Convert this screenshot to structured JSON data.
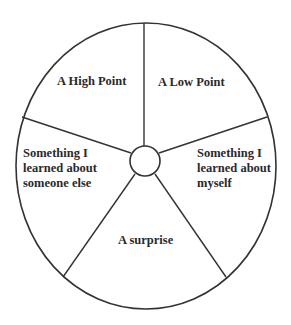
{
  "diagram": {
    "type": "wheel",
    "line_color": "#333333",
    "background_color": "#ffffff",
    "segments": [
      {
        "id": "high-point",
        "label": "A High Point"
      },
      {
        "id": "low-point",
        "label": "A Low Point"
      },
      {
        "id": "learned-myself",
        "label": "Something I\nlearned about\nmyself"
      },
      {
        "id": "surprise",
        "label": "A surprise"
      },
      {
        "id": "learned-someone-else",
        "label": "Something I\nlearned about\nsomeone else"
      }
    ]
  }
}
